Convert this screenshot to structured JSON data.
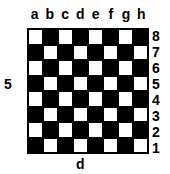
{
  "board": {
    "files": [
      "a",
      "b",
      "c",
      "d",
      "e",
      "f",
      "g",
      "h"
    ],
    "ranks": [
      "8",
      "7",
      "6",
      "5",
      "4",
      "3",
      "2",
      "1"
    ],
    "top_left_square_color": "light",
    "colors": {
      "light": "#ffffff",
      "dark": "#000000"
    }
  },
  "labels": {
    "left": "5",
    "bottom": "d"
  }
}
